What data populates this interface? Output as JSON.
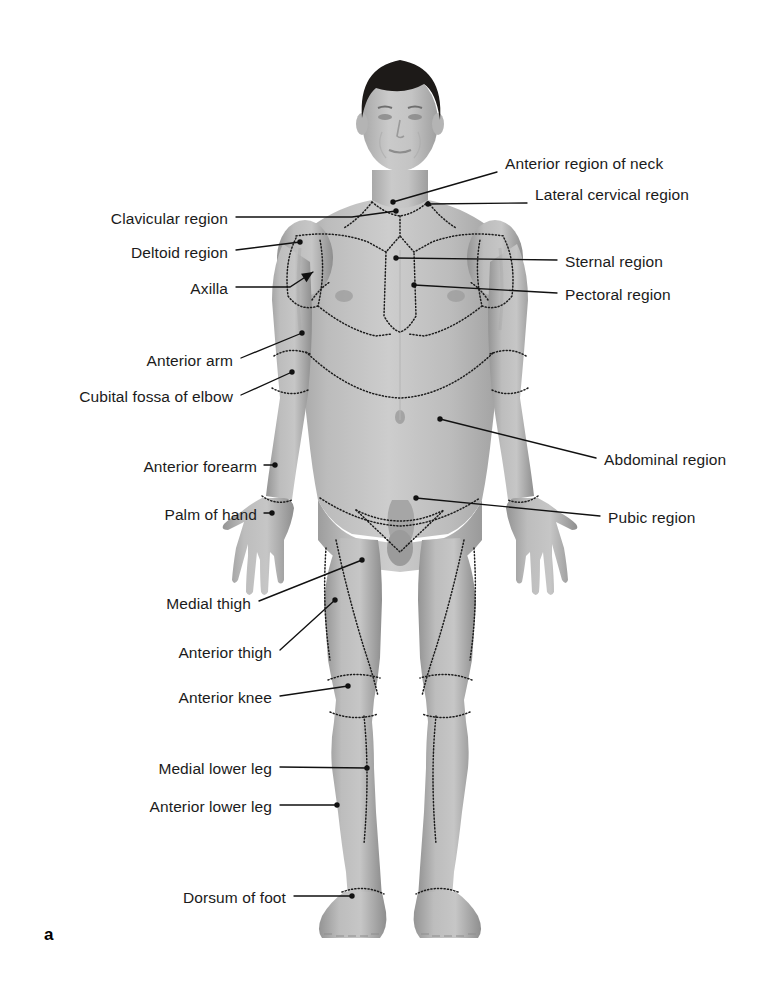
{
  "figure": {
    "panel_letter": "a",
    "view": "anterior",
    "colors": {
      "background": "#ffffff",
      "skin_light": "#cfcfcf",
      "skin_mid": "#b2b2b2",
      "skin_shadow": "#8f8f8f",
      "hair": "#1d1a18",
      "leader_line": "#111111",
      "label_text": "#1b1b1b",
      "region_boundary": "#1c1c1c"
    }
  },
  "labels_left": [
    {
      "id": "clavicular-region",
      "text": "Clavicular region",
      "text_x": 228,
      "text_y": 222,
      "line": [
        [
          236,
          217
        ],
        [
          352,
          217
        ],
        [
          396,
          211
        ]
      ],
      "marker": "dot",
      "tip": [
        396,
        211
      ]
    },
    {
      "id": "deltoid-region",
      "text": "Deltoid region",
      "text_x": 228,
      "text_y": 256,
      "line": [
        [
          236,
          250
        ],
        [
          300,
          242
        ]
      ],
      "marker": "dot",
      "tip": [
        300,
        242
      ]
    },
    {
      "id": "axilla",
      "text": "Axilla",
      "text_x": 228,
      "text_y": 292,
      "line": [
        [
          236,
          287
        ],
        [
          290,
          287
        ],
        [
          313,
          272
        ]
      ],
      "marker": "arrow",
      "tip": [
        313,
        272
      ]
    },
    {
      "id": "anterior-arm",
      "text": "Anterior arm",
      "text_x": 233,
      "text_y": 364,
      "line": [
        [
          241,
          358
        ],
        [
          302,
          333
        ]
      ],
      "marker": "dot",
      "tip": [
        302,
        333
      ]
    },
    {
      "id": "cubital-fossa",
      "text": "Cubital fossa of elbow",
      "text_x": 233,
      "text_y": 400,
      "line": [
        [
          241,
          395
        ],
        [
          292,
          372
        ]
      ],
      "marker": "dot",
      "tip": [
        292,
        372
      ]
    },
    {
      "id": "anterior-forearm",
      "text": "Anterior forearm",
      "text_x": 257,
      "text_y": 470,
      "line": [
        [
          264,
          465
        ],
        [
          275,
          465
        ]
      ],
      "marker": "dot",
      "tip": [
        275,
        465
      ]
    },
    {
      "id": "palm-of-hand",
      "text": "Palm of hand",
      "text_x": 257,
      "text_y": 518,
      "line": [
        [
          264,
          513
        ],
        [
          272,
          513
        ]
      ],
      "marker": "dot",
      "tip": [
        272,
        513
      ]
    },
    {
      "id": "medial-thigh",
      "text": "Medial thigh",
      "text_x": 251,
      "text_y": 607,
      "line": [
        [
          259,
          601
        ],
        [
          362,
          560
        ]
      ],
      "marker": "dot",
      "tip": [
        362,
        560
      ]
    },
    {
      "id": "anterior-thigh",
      "text": "Anterior thigh",
      "text_x": 272,
      "text_y": 656,
      "line": [
        [
          280,
          650
        ],
        [
          335,
          600
        ]
      ],
      "marker": "dot",
      "tip": [
        335,
        600
      ]
    },
    {
      "id": "anterior-knee",
      "text": "Anterior knee",
      "text_x": 272,
      "text_y": 701,
      "line": [
        [
          280,
          696
        ],
        [
          348,
          686
        ]
      ],
      "marker": "dot",
      "tip": [
        348,
        686
      ]
    },
    {
      "id": "medial-lower-leg",
      "text": "Medial lower leg",
      "text_x": 272,
      "text_y": 772,
      "line": [
        [
          280,
          767
        ],
        [
          367,
          768
        ]
      ],
      "marker": "dot",
      "tip": [
        367,
        768
      ]
    },
    {
      "id": "anterior-lower-leg",
      "text": "Anterior lower leg",
      "text_x": 272,
      "text_y": 810,
      "line": [
        [
          280,
          805
        ],
        [
          337,
          805
        ]
      ],
      "marker": "dot",
      "tip": [
        337,
        805
      ]
    },
    {
      "id": "dorsum-of-foot",
      "text": "Dorsum of foot",
      "text_x": 286,
      "text_y": 901,
      "line": [
        [
          294,
          896
        ],
        [
          352,
          896
        ]
      ],
      "marker": "dot",
      "tip": [
        352,
        896
      ]
    }
  ],
  "labels_right": [
    {
      "id": "anterior-region-of-neck",
      "text": "Anterior region of neck",
      "text_x": 505,
      "text_y": 167,
      "line": [
        [
          497,
          172
        ],
        [
          393,
          202
        ]
      ],
      "marker": "dot",
      "tip": [
        393,
        202
      ]
    },
    {
      "id": "lateral-cervical-region",
      "text": "Lateral cervical region",
      "text_x": 535,
      "text_y": 198,
      "line": [
        [
          527,
          203
        ],
        [
          428,
          204
        ]
      ],
      "marker": "dot",
      "tip": [
        428,
        204
      ]
    },
    {
      "id": "sternal-region",
      "text": "Sternal region",
      "text_x": 565,
      "text_y": 265,
      "line": [
        [
          557,
          260
        ],
        [
          396,
          258
        ]
      ],
      "marker": "dot",
      "tip": [
        396,
        258
      ]
    },
    {
      "id": "pectoral-region",
      "text": "Pectoral region",
      "text_x": 565,
      "text_y": 298,
      "line": [
        [
          557,
          293
        ],
        [
          414,
          285
        ]
      ],
      "marker": "dot",
      "tip": [
        414,
        285
      ]
    },
    {
      "id": "abdominal-region",
      "text": "Abdominal region",
      "text_x": 604,
      "text_y": 463,
      "line": [
        [
          596,
          458
        ],
        [
          440,
          419
        ]
      ],
      "marker": "dot",
      "tip": [
        440,
        419
      ]
    },
    {
      "id": "pubic-region",
      "text": "Pubic region",
      "text_x": 608,
      "text_y": 521,
      "line": [
        [
          600,
          516
        ],
        [
          416,
          498
        ]
      ],
      "marker": "dot",
      "tip": [
        416,
        498
      ]
    }
  ]
}
